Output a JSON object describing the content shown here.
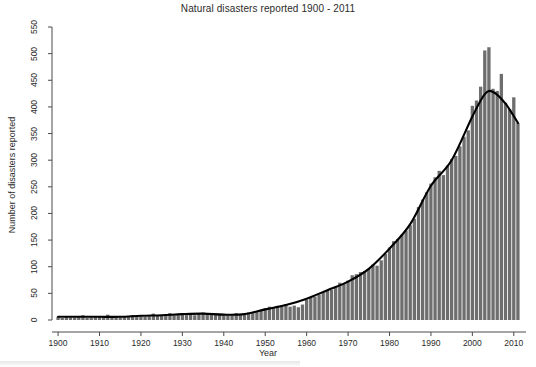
{
  "chart_data": {
    "type": "bar",
    "title": "Natural disasters reported 1900 - 2011",
    "xlabel": "Year",
    "ylabel": "Number of disasters reported",
    "grid": false,
    "legend": null,
    "xlim": [
      1899.5,
      2011.5
    ],
    "ylim": [
      0,
      550
    ],
    "xticks": [
      1900,
      1910,
      1920,
      1930,
      1940,
      1950,
      1960,
      1970,
      1980,
      1990,
      2000,
      2010
    ],
    "yticks": [
      0,
      50,
      100,
      150,
      200,
      250,
      300,
      350,
      400,
      450,
      500,
      550
    ],
    "bar_color": "#6e6e6e",
    "line_color": "#000000",
    "series": [
      {
        "name": "Disasters reported",
        "type": "bar",
        "x": [
          1900,
          1901,
          1902,
          1903,
          1904,
          1905,
          1906,
          1907,
          1908,
          1909,
          1910,
          1911,
          1912,
          1913,
          1914,
          1915,
          1916,
          1917,
          1918,
          1919,
          1920,
          1921,
          1922,
          1923,
          1924,
          1925,
          1926,
          1927,
          1928,
          1929,
          1930,
          1931,
          1932,
          1933,
          1934,
          1935,
          1936,
          1937,
          1938,
          1939,
          1940,
          1941,
          1942,
          1943,
          1944,
          1945,
          1946,
          1947,
          1948,
          1949,
          1950,
          1951,
          1952,
          1953,
          1954,
          1955,
          1956,
          1957,
          1958,
          1959,
          1960,
          1961,
          1962,
          1963,
          1964,
          1965,
          1966,
          1967,
          1968,
          1969,
          1970,
          1971,
          1972,
          1973,
          1974,
          1975,
          1976,
          1977,
          1978,
          1979,
          1980,
          1981,
          1982,
          1983,
          1984,
          1985,
          1986,
          1987,
          1988,
          1989,
          1990,
          1991,
          1992,
          1993,
          1994,
          1995,
          1996,
          1997,
          1998,
          1999,
          2000,
          2001,
          2002,
          2003,
          2004,
          2005,
          2006,
          2007,
          2008,
          2009,
          2010,
          2011
        ],
        "values": [
          6,
          4,
          6,
          5,
          5,
          7,
          9,
          4,
          5,
          6,
          6,
          7,
          10,
          6,
          5,
          5,
          6,
          6,
          9,
          6,
          7,
          6,
          7,
          12,
          8,
          9,
          11,
          13,
          9,
          9,
          13,
          12,
          10,
          9,
          12,
          14,
          12,
          11,
          11,
          10,
          9,
          9,
          11,
          13,
          11,
          10,
          14,
          15,
          16,
          18,
          22,
          25,
          23,
          24,
          28,
          30,
          25,
          27,
          24,
          29,
          38,
          42,
          44,
          48,
          52,
          56,
          57,
          62,
          70,
          68,
          74,
          84,
          86,
          90,
          92,
          96,
          104,
          102,
          112,
          124,
          136,
          148,
          152,
          160,
          168,
          178,
          190,
          212,
          226,
          240,
          256,
          268,
          280,
          272,
          290,
          302,
          308,
          326,
          344,
          356,
          402,
          412,
          438,
          506,
          512,
          434,
          430,
          462,
          408,
          396,
          418,
          370
        ],
        "highlight_points": [
          {
            "year": 2003,
            "value": 506
          },
          {
            "year": 2004,
            "value": 512
          },
          {
            "year": 2005,
            "value": 434
          },
          {
            "year": 2007,
            "value": 462
          },
          {
            "year": 2010,
            "value": 418
          },
          {
            "year": 2011,
            "value": 370
          }
        ]
      },
      {
        "name": "Smoothed trend",
        "type": "line",
        "x": [
          1900,
          1905,
          1910,
          1915,
          1920,
          1925,
          1930,
          1935,
          1940,
          1945,
          1950,
          1955,
          1960,
          1965,
          1970,
          1975,
          1980,
          1985,
          1990,
          1995,
          2000,
          2003,
          2005,
          2008,
          2011
        ],
        "values": [
          6,
          6,
          6,
          6,
          8,
          9,
          11,
          12,
          10,
          11,
          20,
          28,
          40,
          56,
          72,
          96,
          134,
          180,
          252,
          300,
          382,
          424,
          428,
          406,
          370
        ]
      }
    ]
  }
}
